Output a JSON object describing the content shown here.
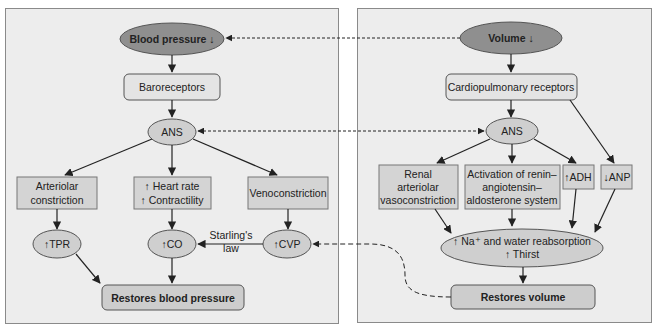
{
  "colors": {
    "panel_bg": "#ededed",
    "panel_border": "#8a8a8a",
    "dark_node": "#8f8f8f",
    "light_node": "#e4e4e4",
    "rect_node": "#d4d4d4",
    "ellipse_node": "#cfcfcf",
    "result_node": "#cdcdcd",
    "line": "#222222"
  },
  "left_panel": {
    "trigger": "Blood pressure ↓",
    "receptor": "Baroreceptors",
    "ans": "ANS",
    "effectors": [
      {
        "lines": [
          "Arteriolar",
          "constriction"
        ]
      },
      {
        "lines": [
          "↑ Heart rate",
          "↑ Contractility"
        ]
      },
      {
        "lines": [
          "Venoconstriction"
        ]
      }
    ],
    "outcomes": [
      "↑TPR",
      "↑CO",
      "↑CVP"
    ],
    "starling_label": [
      "Starling's",
      "law"
    ],
    "result": "Restores blood pressure"
  },
  "right_panel": {
    "trigger": "Volume ↓",
    "receptor": "Cardiopulmonary receptors",
    "ans": "ANS",
    "effectors": [
      {
        "lines": [
          "Renal",
          "arteriolar",
          "vasoconstriction"
        ]
      },
      {
        "lines": [
          "Activation of renin–",
          "angiotensin–",
          "aldosterone system"
        ]
      },
      {
        "lines": [
          "↑ADH"
        ]
      },
      {
        "lines": [
          "↓ANP"
        ]
      }
    ],
    "outcome": [
      "↑ Na⁺ and water reabsorption",
      "↑ Thirst"
    ],
    "result": "Restores volume"
  }
}
